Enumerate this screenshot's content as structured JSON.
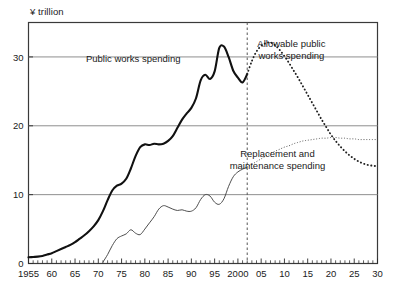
{
  "chart_data": {
    "type": "line",
    "title": "",
    "subtitle": "",
    "xlabel": "",
    "ylabel": "¥ trillion",
    "ylim": [
      0,
      35
    ],
    "xlim": [
      1955,
      2030
    ],
    "yticks": [
      0,
      10,
      20,
      30
    ],
    "ytick_labels": [
      "0",
      "10",
      "20",
      "30"
    ],
    "xticks": [
      1955,
      1960,
      1965,
      1970,
      1975,
      1980,
      1985,
      1990,
      1995,
      2000,
      2005,
      2010,
      2015,
      2020,
      2025,
      2030
    ],
    "xtick_labels": [
      "1955",
      "60",
      "65",
      "70",
      "75",
      "80",
      "85",
      "90",
      "95",
      "2000",
      "05",
      "10",
      "15",
      "20",
      "25",
      "30"
    ],
    "minor_tick_interval": 1,
    "grid": "horizontal-only",
    "gridlines_at": [
      10,
      20,
      30
    ],
    "legend": "inline-annotations",
    "annotations": [
      {
        "id": "public-works-spending",
        "text": "Public works spending",
        "x": 1977.5,
        "y": 29.2
      },
      {
        "id": "allowable-public-works-spending",
        "line1": "Allowable public",
        "line2": "works spending",
        "x": 2011.5,
        "y": 31.5
      },
      {
        "id": "replacement-and-maintenance-spending",
        "line1": "Replacement and",
        "line2": "maintenance spending",
        "x": 2008.5,
        "y": 15.5
      }
    ],
    "divider": {
      "id": "forecast-divider",
      "x": 2002,
      "style": "dashed",
      "color": "#555555"
    },
    "series": [
      {
        "name": "Public works spending",
        "style": "solid-thick",
        "color": "#111111",
        "period": "actual",
        "x": [
          1955,
          1956,
          1957,
          1958,
          1959,
          1960,
          1961,
          1962,
          1963,
          1964,
          1965,
          1966,
          1967,
          1968,
          1969,
          1970,
          1971,
          1972,
          1973,
          1974,
          1975,
          1976,
          1977,
          1978,
          1979,
          1980,
          1981,
          1982,
          1983,
          1984,
          1985,
          1986,
          1987,
          1988,
          1989,
          1990,
          1991,
          1992,
          1993,
          1994,
          1995,
          1996,
          1997,
          1998,
          1999,
          2000,
          2001,
          2002
        ],
        "values": [
          0.9,
          0.95,
          1.0,
          1.1,
          1.3,
          1.5,
          1.8,
          2.1,
          2.4,
          2.7,
          3.1,
          3.6,
          4.1,
          4.7,
          5.4,
          6.3,
          7.6,
          9.2,
          10.6,
          11.3,
          11.6,
          12.3,
          13.8,
          15.6,
          16.9,
          17.3,
          17.2,
          17.4,
          17.3,
          17.4,
          17.8,
          18.5,
          19.7,
          20.9,
          21.8,
          22.6,
          24.0,
          26.6,
          27.4,
          26.8,
          27.9,
          31.3,
          31.5,
          30.0,
          28.0,
          27.0,
          26.3,
          27.5
        ]
      },
      {
        "name": "Replacement and maintenance spending",
        "style": "solid-thin",
        "color": "#444444",
        "period": "actual",
        "x": [
          1971,
          1972,
          1973,
          1974,
          1975,
          1976,
          1977,
          1978,
          1979,
          1980,
          1981,
          1982,
          1983,
          1984,
          1985,
          1986,
          1987,
          1988,
          1989,
          1990,
          1991,
          1992,
          1993,
          1994,
          1995,
          1996,
          1997,
          1998,
          1999,
          2000,
          2001,
          2002
        ],
        "values": [
          0.2,
          1.3,
          2.6,
          3.6,
          4.0,
          4.3,
          4.9,
          4.4,
          4.2,
          5.0,
          5.9,
          6.8,
          7.9,
          8.4,
          8.2,
          7.9,
          7.7,
          7.8,
          7.6,
          7.6,
          8.1,
          9.3,
          10.0,
          9.8,
          8.9,
          8.6,
          9.4,
          11.2,
          12.6,
          13.3,
          13.7,
          14.0
        ]
      },
      {
        "name": "Allowable public works spending",
        "style": "dotted-bold",
        "color": "#222222",
        "period": "projection",
        "x": [
          2002,
          2003,
          2004,
          2005,
          2006,
          2007,
          2008,
          2009,
          2010,
          2011,
          2012,
          2013,
          2014,
          2015,
          2016,
          2017,
          2018,
          2019,
          2020,
          2021,
          2022,
          2023,
          2024,
          2025,
          2026,
          2027,
          2028,
          2029,
          2030
        ],
        "values": [
          27.5,
          29.4,
          30.8,
          31.6,
          32.0,
          32.1,
          31.7,
          31.0,
          30.1,
          29.1,
          28.0,
          26.9,
          25.7,
          24.5,
          23.3,
          22.1,
          20.9,
          19.8,
          18.7,
          17.8,
          17.0,
          16.3,
          15.7,
          15.2,
          14.8,
          14.5,
          14.3,
          14.2,
          14.1
        ]
      },
      {
        "name": "Replacement and maintenance spending (projection)",
        "style": "dotted-fine",
        "color": "#555555",
        "period": "projection",
        "x": [
          2002,
          2003,
          2004,
          2005,
          2006,
          2007,
          2008,
          2009,
          2010,
          2011,
          2012,
          2013,
          2014,
          2015,
          2016,
          2017,
          2018,
          2019,
          2020,
          2021,
          2022,
          2023,
          2024,
          2025,
          2026,
          2027,
          2028,
          2029,
          2030
        ],
        "values": [
          14.0,
          14.4,
          14.8,
          15.2,
          15.6,
          16.0,
          16.3,
          16.6,
          16.9,
          17.1,
          17.4,
          17.6,
          17.8,
          17.9,
          18.0,
          18.1,
          18.2,
          18.2,
          18.3,
          18.3,
          18.2,
          18.2,
          18.1,
          18.1,
          18.0,
          18.0,
          18.0,
          18.0,
          18.0
        ]
      }
    ]
  }
}
